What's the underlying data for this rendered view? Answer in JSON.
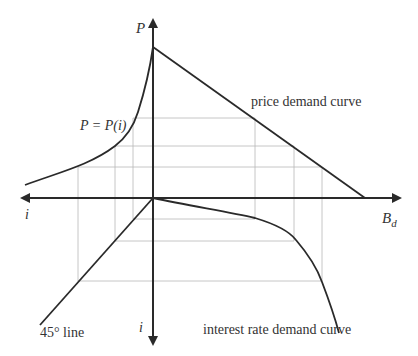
{
  "diagram": {
    "title": "",
    "axes": {
      "up": {
        "label": "P"
      },
      "left": {
        "label": "i"
      },
      "right": {
        "label": "B",
        "subscript": "d"
      },
      "down": {
        "label": "i"
      }
    },
    "labels": {
      "price_relation": "P = P(i)",
      "price_demand": "price demand curve",
      "interest_demand": "interest rate demand curve",
      "forty_five": "45° line"
    },
    "curves": [
      {
        "name": "P = P(i)",
        "quadrant": "upper-left"
      },
      {
        "name": "price demand curve",
        "quadrant": "upper-right"
      },
      {
        "name": "45° line",
        "quadrant": "lower-left"
      },
      {
        "name": "interest rate demand curve",
        "quadrant": "lower-right"
      }
    ],
    "colors": {
      "ink": "#2a2a2a",
      "grid": "#b8b8b8",
      "text": "#333333"
    }
  }
}
